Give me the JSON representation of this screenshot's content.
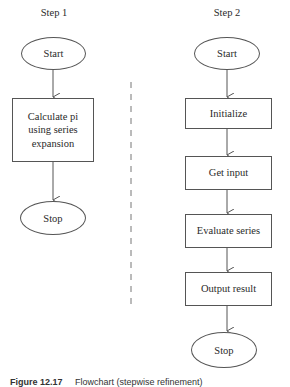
{
  "diagram": {
    "type": "flowchart",
    "step1": {
      "title": "Step 1",
      "nodes": [
        {
          "id": "s1-start",
          "shape": "ellipse",
          "label": "Start"
        },
        {
          "id": "s1-calc",
          "shape": "rectangle",
          "label_lines": [
            "Calculate pi",
            "using series",
            "expansion"
          ]
        },
        {
          "id": "s1-stop",
          "shape": "ellipse",
          "label": "Stop"
        }
      ]
    },
    "step2": {
      "title": "Step 2",
      "nodes": [
        {
          "id": "s2-start",
          "shape": "ellipse",
          "label": "Start"
        },
        {
          "id": "s2-init",
          "shape": "rectangle",
          "label": "Initialize"
        },
        {
          "id": "s2-input",
          "shape": "rectangle",
          "label": "Get input"
        },
        {
          "id": "s2-eval",
          "shape": "rectangle",
          "label": "Evaluate series"
        },
        {
          "id": "s2-output",
          "shape": "rectangle",
          "label": "Output result"
        },
        {
          "id": "s2-stop",
          "shape": "ellipse",
          "label": "Stop"
        }
      ]
    },
    "edges": [
      [
        "s1-start",
        "s1-calc"
      ],
      [
        "s1-calc",
        "s1-stop"
      ],
      [
        "s2-start",
        "s2-init"
      ],
      [
        "s2-init",
        "s2-input"
      ],
      [
        "s2-input",
        "s2-eval"
      ],
      [
        "s2-eval",
        "s2-output"
      ],
      [
        "s2-output",
        "s2-stop"
      ]
    ],
    "separator": "dashed-vertical-line",
    "caption": {
      "figure_label": "Figure 12.17",
      "text": "Flowchart (stepwise refinement)",
      "clipped": true
    },
    "colors": {
      "line": "#555555",
      "text": "#2a2a2a",
      "background": "#ffffff"
    }
  }
}
